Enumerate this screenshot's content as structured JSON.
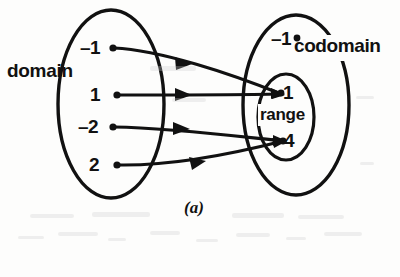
{
  "figure": {
    "caption": "(a)",
    "kind": "function-mapping-diagram",
    "ink_color": "#111111",
    "background_color": "#fdfdfc"
  },
  "domain": {
    "label": "domain",
    "elements": [
      {
        "value": "–1"
      },
      {
        "value": "1"
      },
      {
        "value": "–2"
      },
      {
        "value": "2"
      }
    ]
  },
  "codomain": {
    "label": "codomain",
    "elements": [
      {
        "value": "–1"
      },
      {
        "value": "1"
      },
      {
        "value": "4"
      }
    ]
  },
  "range": {
    "label": "range",
    "elements": [
      {
        "value": "1"
      },
      {
        "value": "4"
      }
    ]
  },
  "mappings": [
    {
      "from": "–1",
      "to": "1"
    },
    {
      "from": "1",
      "to": "1"
    },
    {
      "from": "–2",
      "to": "4"
    },
    {
      "from": "2",
      "to": "4"
    }
  ]
}
